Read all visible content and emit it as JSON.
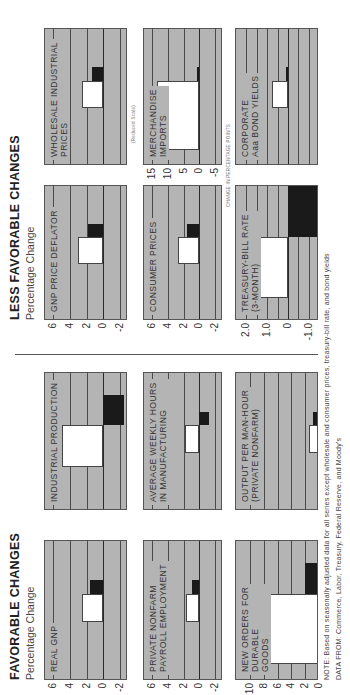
{
  "favorable": {
    "title": "FAVORABLE CHANGES",
    "subtitle": "Percentage Change"
  },
  "less_favorable": {
    "title": "LESS FAVORABLE CHANGES",
    "subtitle": "Percentage Change"
  },
  "annotations": {
    "reduced_scale": "(Reduced Scale)",
    "percentage_points": "CHANGE IN PERCENTAGE POINTS"
  },
  "footer": {
    "note": "NOTE:  Based on seasonally adjusted data for all series except wholesale and consumer prices, treasury-bill rate, and bond yields",
    "source": "DATA FROM:  Commerce, Labor, Treasury, Federal Reserve, and Moody's"
  },
  "chart_data": [
    {
      "type": "bar",
      "title": "REAL GNP",
      "section": "favorable",
      "ylabel": "Percentage Change",
      "ticks": [
        "6",
        "4",
        "2",
        "0",
        "-2"
      ],
      "ylim": [
        -3,
        7
      ],
      "series": [
        {
          "name": "dark bar",
          "values": [
            1.6
          ]
        },
        {
          "name": "white bar",
          "values": [
            2.6
          ]
        }
      ]
    },
    {
      "type": "bar",
      "title": "INDUSTRIAL PRODUCTION",
      "section": "favorable",
      "ylabel": "Percentage Change",
      "ticks": [
        "6",
        "4",
        "2",
        "0",
        "-2"
      ],
      "ylim": [
        -3,
        7
      ],
      "series": [
        {
          "name": "dark bar",
          "values": [
            -2.5
          ]
        },
        {
          "name": "white bar",
          "values": [
            5.0
          ]
        }
      ]
    },
    {
      "type": "bar",
      "title": "PRIVATE NONFARM\nPAYROLL EMPLOYMENT",
      "section": "favorable",
      "ylabel": "Percentage Change",
      "ticks": [
        "6",
        "4",
        "2",
        "0",
        "-2"
      ],
      "ylim": [
        -3,
        7
      ],
      "series": [
        {
          "name": "dark bar",
          "values": [
            0.9
          ]
        },
        {
          "name": "white bar",
          "values": [
            1.7
          ]
        }
      ]
    },
    {
      "type": "bar",
      "title": "AVERAGE WEEKLY HOURS\nIN MANUFACTURING",
      "section": "favorable",
      "ylabel": "Percentage Change",
      "ticks": [
        "6",
        "4",
        "2",
        "0",
        "-2"
      ],
      "ylim": [
        -3,
        7
      ],
      "series": [
        {
          "name": "dark bar",
          "values": [
            -1.2
          ]
        },
        {
          "name": "white bar",
          "values": [
            1.8
          ]
        }
      ]
    },
    {
      "type": "bar",
      "title": "NEW ORDERS FOR\nDURABLE\nGOODS",
      "section": "favorable",
      "ylabel": "Percentage Change",
      "ticks": [
        "10",
        "8",
        "6",
        "4",
        "2",
        "0"
      ],
      "ylim": [
        0,
        12
      ],
      "series": [
        {
          "name": "dark bar",
          "values": [
            2.0
          ]
        },
        {
          "name": "white bar",
          "values": [
            8.8
          ]
        }
      ]
    },
    {
      "type": "bar",
      "title": "OUTPUT PER MAN-HOUR\n(PRIVATE NONFARM)",
      "section": "favorable",
      "ylabel": "Percentage Change",
      "ticks": [
        "10",
        "8",
        "6",
        "4",
        "2",
        "0"
      ],
      "ylim": [
        0,
        12
      ],
      "series": [
        {
          "name": "dark bar",
          "values": [
            0.9
          ]
        },
        {
          "name": "white bar",
          "values": [
            1.4
          ]
        }
      ]
    },
    {
      "type": "bar",
      "title": "GNP PRICE DEFLATOR",
      "section": "less_favorable",
      "ylabel": "Percentage Change",
      "ticks": [
        "6",
        "4",
        "2",
        "0",
        "-2"
      ],
      "ylim": [
        -3,
        7
      ],
      "series": [
        {
          "name": "dark bar",
          "values": [
            1.8
          ]
        },
        {
          "name": "white bar",
          "values": [
            3.0
          ]
        }
      ]
    },
    {
      "type": "bar",
      "title": "WHOLESALE INDUSTRIAL\nPRICES",
      "section": "less_favorable",
      "ylabel": "Percentage Change",
      "ticks": [
        "6",
        "4",
        "2",
        "0",
        "-2"
      ],
      "ylim": [
        -3,
        7
      ],
      "series": [
        {
          "name": "dark bar",
          "values": [
            1.3
          ]
        },
        {
          "name": "white bar",
          "values": [
            2.5
          ]
        }
      ]
    },
    {
      "type": "bar",
      "title": "CONSUMER PRICES",
      "section": "less_favorable",
      "ylabel": "Percentage Change",
      "ticks": [
        "6",
        "4",
        "2",
        "0",
        "-2"
      ],
      "ylim": [
        -3,
        7
      ],
      "series": [
        {
          "name": "dark bar",
          "values": [
            1.5
          ]
        },
        {
          "name": "white bar",
          "values": [
            2.7
          ]
        }
      ]
    },
    {
      "type": "bar",
      "title": "MERCHANDISE\nIMPORTS",
      "section": "less_favorable",
      "ylabel": "Percentage Change (Reduced Scale)",
      "ticks": [
        "15",
        "10",
        "5",
        "0",
        "-5"
      ],
      "ylim": [
        -7.5,
        17.5
      ],
      "series": [
        {
          "name": "dark bar",
          "values": [
            0.6
          ]
        },
        {
          "name": "white bar",
          "values": [
            13.5
          ]
        }
      ]
    },
    {
      "type": "bar",
      "title": "TREASURY-BILL RATE\n(3-MONTH)",
      "section": "less_favorable",
      "ylabel": "Change in Percentage Points",
      "ticks": [
        "2.0",
        "1.0",
        "0",
        "-1.0"
      ],
      "ylim": [
        -1.5,
        2.5
      ],
      "series": [
        {
          "name": "dark bar",
          "values": [
            -1.5
          ]
        },
        {
          "name": "white bar",
          "values": [
            1.5
          ]
        }
      ]
    },
    {
      "type": "bar",
      "title": "CORPORATE\nAaa BOND YIELDS",
      "section": "less_favorable",
      "ylabel": "Change in Percentage Points",
      "ticks": [
        "2.0",
        "1.0",
        "0",
        "-1.0"
      ],
      "ylim": [
        -1.5,
        2.5
      ],
      "series": [
        {
          "name": "dark bar",
          "values": [
            0.1
          ]
        },
        {
          "name": "white bar",
          "values": [
            0.75
          ]
        }
      ]
    }
  ]
}
